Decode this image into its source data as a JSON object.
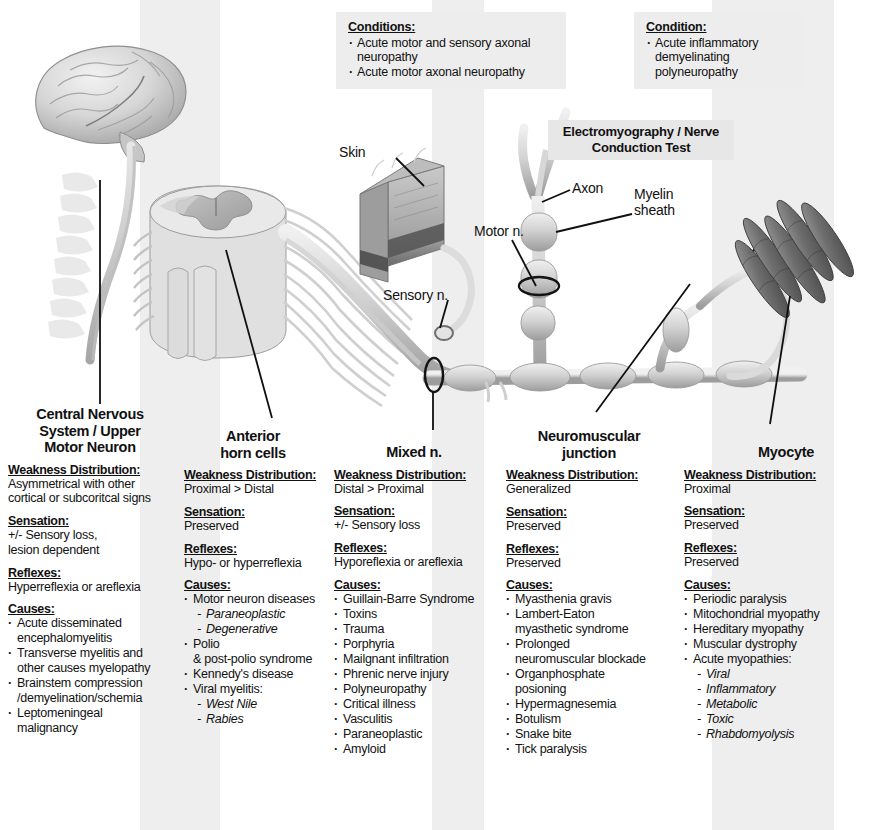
{
  "callouts": [
    {
      "id": "axonal",
      "header": "Conditions:",
      "items": [
        "Acute motor and\nsensory axonal neuropathy",
        "Acute motor axonal neuropathy"
      ]
    },
    {
      "id": "demyelinating",
      "header": "Condition:",
      "items": [
        "Acute inflammatory\ndemyelinating\npolyneuropathy"
      ]
    }
  ],
  "emg_label": "Electromyography /\nNerve Conduction Test",
  "anatomy_labels": {
    "skin": "Skin",
    "axon": "Axon",
    "myelin_sheath": "Myelin\nsheath",
    "motor_nerve": "Motor n.",
    "sensory_nerve": "Sensory n."
  },
  "section_headers": {
    "weakness": "Weakness Distribution:",
    "sensation": "Sensation:",
    "reflexes": "Reflexes:",
    "causes": "Causes:"
  },
  "columns": [
    {
      "title": "Central Nervous\nSystem / Upper\nMotor Neuron",
      "weakness": "Asymmetrical with other\ncortical or subcoritcal signs",
      "sensation": "+/- Sensory loss,\nlesion dependent",
      "reflexes": "Hyperreflexia or areflexia",
      "causes": [
        {
          "text": "Acute disseminated\nencephalomyelitis",
          "sub": false
        },
        {
          "text": "Transverse myelitis and\nother causes myelopathy",
          "sub": false
        },
        {
          "text": "Brainstem compression\n/demyelination/schemia",
          "sub": false
        },
        {
          "text": "Leptomeningeal\nmalignancy",
          "sub": false
        }
      ]
    },
    {
      "title": "Anterior\nhorn cells",
      "weakness": "Proximal > Distal",
      "sensation": "Preserved",
      "reflexes": "Hypo- or hyperreflexia",
      "causes": [
        {
          "text": "Motor neuron diseases",
          "sub": false
        },
        {
          "text": "Paraneoplastic",
          "sub": true
        },
        {
          "text": "Degenerative",
          "sub": true
        },
        {
          "text": "Polio",
          "sub": false
        },
        {
          "text": "& post-polio syndrome",
          "sub": false,
          "nobullet": true
        },
        {
          "text": "Kennedy's disease",
          "sub": false
        },
        {
          "text": "Viral myelitis:",
          "sub": false
        },
        {
          "text": "West Nile",
          "sub": true
        },
        {
          "text": "Rabies",
          "sub": true
        }
      ]
    },
    {
      "title": "Mixed n.",
      "weakness": "Distal > Proximal",
      "sensation": "+/- Sensory loss",
      "reflexes": "Hyporeflexia or areflexia",
      "causes": [
        {
          "text": "Guillain-Barre Syndrome",
          "sub": false
        },
        {
          "text": "Toxins",
          "sub": false
        },
        {
          "text": "Trauma",
          "sub": false
        },
        {
          "text": "Porphyria",
          "sub": false
        },
        {
          "text": "Mailgnant infiltration",
          "sub": false
        },
        {
          "text": "Phrenic nerve injury",
          "sub": false
        },
        {
          "text": "Polyneuropathy",
          "sub": false
        },
        {
          "text": "Critical illness",
          "sub": false
        },
        {
          "text": "Vasculitis",
          "sub": false
        },
        {
          "text": "Paraneoplastic",
          "sub": false
        },
        {
          "text": "Amyloid",
          "sub": false
        }
      ]
    },
    {
      "title": "Neuromuscular\njunction",
      "weakness": "Generalized",
      "sensation": "Preserved",
      "reflexes": "Preserved",
      "causes": [
        {
          "text": "Myasthenia gravis",
          "sub": false
        },
        {
          "text": "Lambert-Eaton\nmyasthetic syndrome",
          "sub": false
        },
        {
          "text": "Prolonged\nneuromuscular blockade",
          "sub": false
        },
        {
          "text": "Organphosphate\nposioning",
          "sub": false
        },
        {
          "text": "Hypermagnesemia",
          "sub": false
        },
        {
          "text": "Botulism",
          "sub": false
        },
        {
          "text": "Snake bite",
          "sub": false
        },
        {
          "text": "Tick paralysis",
          "sub": false
        }
      ]
    },
    {
      "title": "Myocyte",
      "weakness": "Proximal",
      "sensation": "Preserved",
      "reflexes": "Preserved",
      "causes": [
        {
          "text": "Periodic paralysis",
          "sub": false
        },
        {
          "text": "Mitochondrial myopathy",
          "sub": false
        },
        {
          "text": "Hereditary myopathy",
          "sub": false
        },
        {
          "text": "Muscular dystrophy",
          "sub": false
        },
        {
          "text": "Acute myopathies:",
          "sub": false
        },
        {
          "text": "Viral",
          "sub": true
        },
        {
          "text": "Inflammatory",
          "sub": true
        },
        {
          "text": "Metabolic",
          "sub": true
        },
        {
          "text": "Toxic",
          "sub": true
        },
        {
          "text": "Rhabdomyolysis",
          "sub": true
        }
      ]
    }
  ],
  "colors": {
    "page_background": "#ffffff",
    "band_shade": "#eeeeee",
    "callout_shade": "#ededed",
    "text": "#111111",
    "art_light": "#dcdcdc",
    "art_mid": "#b9b9b9",
    "art_dark": "#7a7a7a",
    "muscle": "#6f6f6f",
    "leader_line": "#101010"
  }
}
